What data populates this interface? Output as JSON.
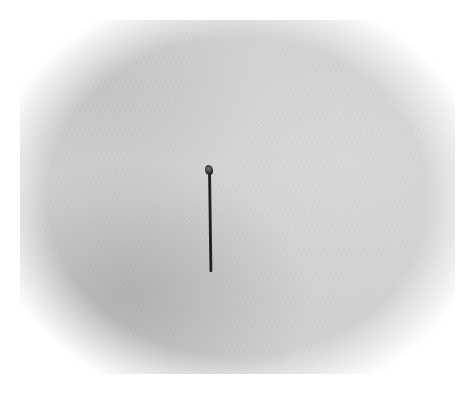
{
  "image": {
    "subject": "pin",
    "background_color": "#d2d2d2",
    "object_color": "#1a1a1a"
  }
}
